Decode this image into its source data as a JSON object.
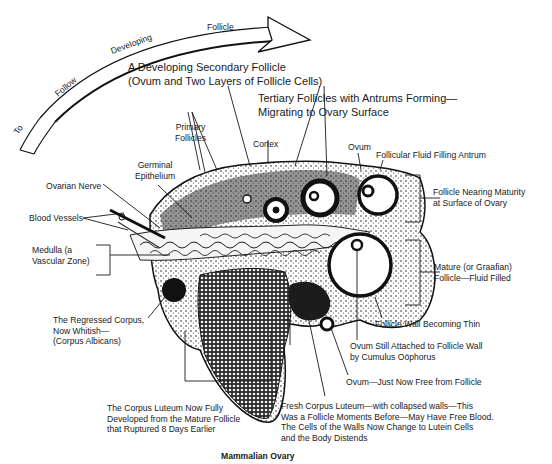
{
  "diagram": {
    "title": "Mammalian Ovary",
    "arrow_caption": {
      "words": [
        "To",
        "Follow",
        "Developing",
        "Follicle"
      ],
      "full_text": "To Follow Developing Follicle"
    },
    "labels": {
      "secondary_follicle": "A Developing Secondary Follicle\n(Ovum and Two Layers of Follicle Cells)",
      "tertiary_follicles": "Tertiary Follicles with Antrums Forming—\nMigrating to Ovary Surface",
      "primary_follicles": "Primary\nFollicles",
      "cortex": "Cortex",
      "ovum_top": "Ovum",
      "follicular_fluid": "Follicular Fluid Filling Antrum",
      "germinal_epithelium": "Germinal\nEpithelium",
      "ovarian_nerve": "Ovarian Nerve",
      "blood_vessels": "Blood Vessels",
      "medulla": "Medulla (a\nVascular Zone)",
      "follicle_nearing_maturity": "Follicle Nearing Maturity\nat Surface of Ovary",
      "mature_follicle": "Mature (or Graafian)\nFollicle—Fluid Filled",
      "regressed_corpus": "The Regressed Corpus,\nNow Whitish—\n(Corpus Albicans)",
      "follicle_wall_thin": "Follicle Wall Becoming Thin",
      "ovum_attached": "Ovum Still Attached to Follicle Wall\nby Cumulus Oöphorus",
      "ovum_free": "Ovum—Just Now Free from Follicle",
      "corpus_luteum_developed": "The Corpus Luteum Now Fully\nDeveloped from the Mature Follicle\nthat Ruptured 8 Days Earlier",
      "fresh_corpus_luteum": "Fresh Corpus Luteum—with collapsed walls—This\nWas a Follicle Moments Before—May Have Free Blood.\nThe Cells of the Walls Now Change to Lutein Cells\nand the Body Distends"
    }
  }
}
